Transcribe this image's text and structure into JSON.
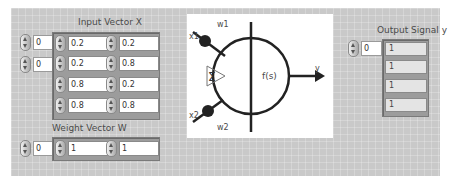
{
  "input_vector": {
    "label": "Input Vector X",
    "row_index": "0",
    "col_index": "0",
    "rows": [
      [
        "0.2",
        "0.2"
      ],
      [
        "0.2",
        "0.8"
      ],
      [
        "0.8",
        "0.2"
      ],
      [
        "0.8",
        "0.8"
      ]
    ]
  },
  "weight_vector": {
    "label": "Weight Vector W",
    "index": "0",
    "values": [
      "1",
      "1"
    ]
  },
  "diagram": {
    "x1": "x1",
    "x2": "x2",
    "w1": "w1",
    "w2": "w2",
    "sum_symbol": "Σ",
    "activation": "f(s)",
    "output": "y",
    "line_color": "#222222"
  },
  "output_signal": {
    "label": "Output Signal y",
    "index": "0",
    "values": [
      "1",
      "1",
      "1",
      "1"
    ]
  },
  "colors": {
    "panel_bg": "#c9c9c9",
    "frame": "#9c9c9c"
  }
}
